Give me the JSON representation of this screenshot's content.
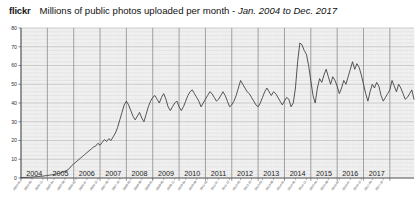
{
  "header": {
    "brand": "flickr",
    "title_main": "Millions of public photos uploaded per month - ",
    "title_range": "Jan. 2004 to Dec. 2017"
  },
  "chart_data": {
    "type": "line",
    "title": "Millions of public photos uploaded per month - Jan. 2004 to Dec. 2017",
    "xlabel": "",
    "ylabel": "",
    "ylim": [
      0,
      80
    ],
    "yticks": [
      0,
      10,
      20,
      30,
      40,
      50,
      60,
      70,
      80
    ],
    "grid": true,
    "legend": "none",
    "line_color": "#3a3a3a",
    "plot_bg": "#f2f2f2",
    "gridline_color": "#b9b9b9",
    "minor_gridline_color": "#d8d8d8",
    "year_labels": [
      "2004",
      "2005",
      "2006",
      "2007",
      "2008",
      "2009",
      "2010",
      "2011",
      "2012",
      "2013",
      "2014",
      "2015",
      "2016",
      "2017"
    ],
    "x_tick_labels": [
      "2004-01",
      "2004-06",
      "2004-11",
      "2005-04",
      "2005-09",
      "2006-02",
      "2006-07",
      "2006-12",
      "2007-05",
      "2007-10",
      "2008-03",
      "2008-08",
      "2009-01",
      "2009-06",
      "2009-11",
      "2010-04",
      "2010-09",
      "2011-02",
      "2011-07",
      "2011-12",
      "2012-05",
      "2012-10",
      "2013-03",
      "2013-08",
      "2014-01",
      "2014-06",
      "2014-11",
      "2015-04",
      "2015-09",
      "2016-02",
      "2016-07",
      "2016-12",
      "2017-05",
      "2017-10"
    ],
    "x_start": "2004-01",
    "x_end": "2017-12",
    "series": [
      {
        "name": "Public photos uploaded per month (millions)",
        "values": [
          0.2,
          0.3,
          0.3,
          0.4,
          0.4,
          0.5,
          0.6,
          0.7,
          0.8,
          0.9,
          1.0,
          1.2,
          1.3,
          1.5,
          1.7,
          1.9,
          2.1,
          2.4,
          2.8,
          3.2,
          3.6,
          4.2,
          5.0,
          6.5,
          7.5,
          8.5,
          9.5,
          10.5,
          11.5,
          12.5,
          13.5,
          14.5,
          15.5,
          16.5,
          17.0,
          18.5,
          17.5,
          19.0,
          20.5,
          19.5,
          21.0,
          20.0,
          22.0,
          24.0,
          27.0,
          31.0,
          35.0,
          39.0,
          41.0,
          39.0,
          36.0,
          33.0,
          31.0,
          33.0,
          35.0,
          32.0,
          30.0,
          34.0,
          38.0,
          41.0,
          43.0,
          44.0,
          42.0,
          40.0,
          43.0,
          45.0,
          42.0,
          38.0,
          36.0,
          38.0,
          40.0,
          41.0,
          38.0,
          36.0,
          38.0,
          41.0,
          44.0,
          46.0,
          47.0,
          45.0,
          43.0,
          41.0,
          38.0,
          40.0,
          42.0,
          44.0,
          46.0,
          45.0,
          43.0,
          41.0,
          42.0,
          44.0,
          46.0,
          44.0,
          41.0,
          38.0,
          39.0,
          41.0,
          44.0,
          48.0,
          52.0,
          50.0,
          48.0,
          46.0,
          45.0,
          43.0,
          41.0,
          39.0,
          38.0,
          40.0,
          43.0,
          46.0,
          48.0,
          46.0,
          44.0,
          46.0,
          45.0,
          43.0,
          41.0,
          39.0,
          41.0,
          43.0,
          42.0,
          38.0,
          40.0,
          48.0,
          62.0,
          72.0,
          71.0,
          68.0,
          66.0,
          60.0,
          52.0,
          44.0,
          40.0,
          48.0,
          53.0,
          51.0,
          55.0,
          58.0,
          54.0,
          50.0,
          54.0,
          52.0,
          49.0,
          45.0,
          48.0,
          52.0,
          50.0,
          54.0,
          58.0,
          62.0,
          58.0,
          61.0,
          59.0,
          55.0,
          50.0,
          45.0,
          41.0,
          46.0,
          50.0,
          48.0,
          51.0,
          49.0,
          44.0,
          41.0,
          43.0,
          45.0,
          47.0,
          52.0,
          49.0,
          46.0,
          50.0,
          48.0,
          45.0,
          42.0,
          43.0,
          45.0,
          47.0,
          42.0
        ]
      }
    ]
  }
}
